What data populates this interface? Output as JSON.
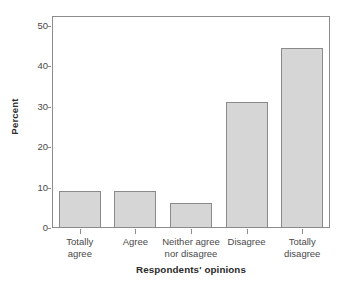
{
  "chart_data": {
    "type": "bar",
    "title": "",
    "xlabel": "Respondents' opinions",
    "ylabel": "Percent",
    "categories": [
      "Totally agree",
      "Agree",
      "Neither agree nor disagree",
      "Disagree",
      "Totally disagree"
    ],
    "category_lines": [
      [
        "Totally",
        "agree"
      ],
      [
        "Agree",
        ""
      ],
      [
        "Neither agree",
        "nor disagree"
      ],
      [
        "Disagree",
        ""
      ],
      [
        "Totally",
        "disagree"
      ]
    ],
    "values": [
      9.1,
      9.1,
      6.1,
      31.2,
      44.5
    ],
    "ylim": [
      0,
      52.5
    ],
    "yticks": [
      0,
      10,
      20,
      30,
      40,
      50
    ],
    "ytick_labels": [
      "0",
      "10",
      "20",
      "30",
      "40",
      "50"
    ],
    "grid": false,
    "legend": false,
    "legend_position": "none",
    "bar_fill_color": "#d6d6d6",
    "bar_edge_color": "#8a8a8a",
    "axis_color": "#8c8c8c",
    "text_color": "#4a4a4a",
    "title_color": "#2b2b2b"
  },
  "axes": {
    "y_title": "Percent",
    "x_title": "Respondents' opinions"
  }
}
